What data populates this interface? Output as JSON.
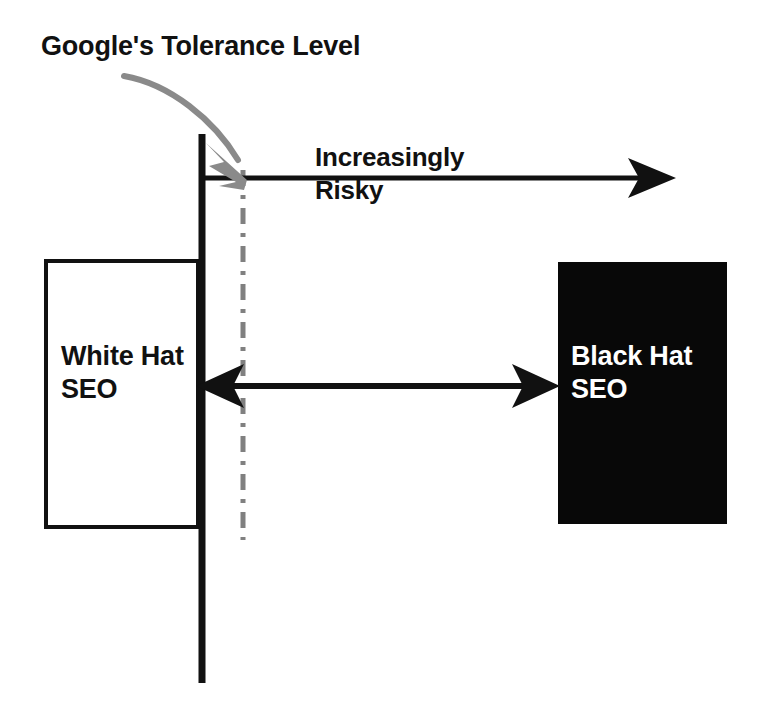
{
  "diagram": {
    "title": "Google's Tolerance Level",
    "boundary_line": {
      "name": "tolerance-boundary-line",
      "color": "#111111"
    },
    "threshold_line": {
      "name": "tolerance-threshold-dash-dot",
      "color": "#808080",
      "style": "dash-dot"
    },
    "pointer_arrow": {
      "name": "tolerance-pointer-arrow",
      "color": "#808080"
    },
    "risk_arrow": {
      "label_line_1": "Increasingly",
      "label_line_2": "Risky",
      "label": "Increasingly Risky",
      "color": "#111111",
      "direction": "right"
    },
    "spectrum_arrow": {
      "name": "white-to-black-spectrum-arrow",
      "color": "#111111",
      "direction": "both"
    },
    "white_box": {
      "line_1": "White Hat",
      "line_2": "SEO",
      "label": "White Hat SEO",
      "fill": "#ffffff",
      "border": "#111111",
      "text_color": "#111111"
    },
    "black_box": {
      "line_1": "Black Hat",
      "line_2": "SEO",
      "label": "Black Hat SEO",
      "fill": "#080808",
      "text_color": "#ffffff"
    }
  }
}
